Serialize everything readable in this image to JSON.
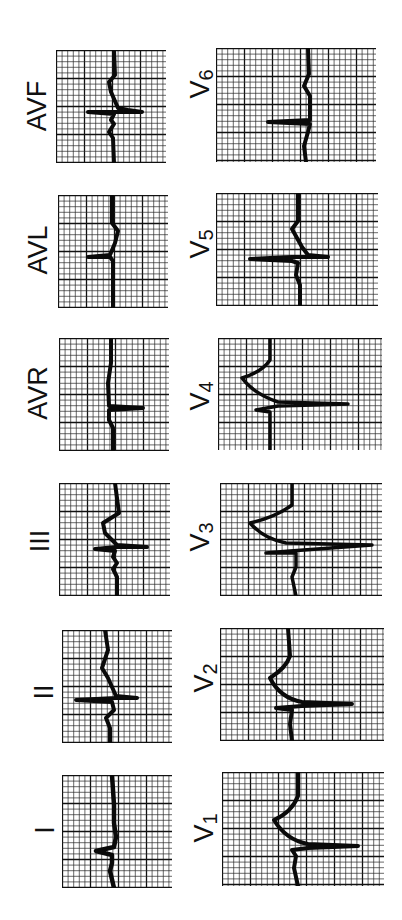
{
  "figure": {
    "orientation": "rotated-counterclockwise",
    "grid": {
      "minor_color": "#2a2a2a",
      "major_color": "#111111",
      "trace_color": "#0a0a0a"
    }
  },
  "columns": [
    {
      "name": "limb-leads",
      "leads": [
        "I",
        "II",
        "III",
        "AVR",
        "AVL",
        "AVF"
      ]
    },
    {
      "name": "precordial-leads",
      "leads": [
        "V1",
        "V2",
        "V3",
        "V4",
        "V5",
        "V6"
      ]
    }
  ],
  "panels": [
    {
      "id": "avf",
      "label": "AVF",
      "label_main": "AVF",
      "label_sub": "",
      "box": {
        "x": 56,
        "y": 50,
        "w": 110,
        "h": 113
      },
      "label_pos": {
        "x": 37,
        "y": 106
      },
      "trace": "M58 0 L59 25 L53 32 L55 42 L62 58 L72 60 L86 62 L62 62 L32 62 L58 64 L55 70 L58 74 L53 82 L57 88 L58 113",
      "trace_width": 4
    },
    {
      "id": "avl",
      "label": "AVL",
      "label_main": "AVL",
      "label_sub": "",
      "box": {
        "x": 58,
        "y": 195,
        "w": 110,
        "h": 113
      },
      "label_pos": {
        "x": 38,
        "y": 250
      },
      "trace": "M54 0 L54 28 L60 36 L57 48 L52 60 L30 62 L52 62 L55 66 L55 113",
      "trace_width": 4
    },
    {
      "id": "avr",
      "label": "AVR",
      "label_main": "AVR",
      "label_sub": "",
      "box": {
        "x": 59,
        "y": 338,
        "w": 110,
        "h": 113
      },
      "label_pos": {
        "x": 38,
        "y": 393
      },
      "trace": "M52 0 L52 25 L49 45 L50 68 L84 70 L50 72 L50 82 L54 90 L54 113",
      "trace_width": 4
    },
    {
      "id": "iii",
      "label": "III",
      "label_main": "III",
      "label_sub": "",
      "box": {
        "x": 59,
        "y": 483,
        "w": 111,
        "h": 113
      },
      "label_pos": {
        "x": 40,
        "y": 541
      },
      "trace": "M56 0 L60 30 L44 40 L46 50 L58 62 L88 64 L58 64 L36 66 L56 68 L54 74 L58 80 L54 86 L58 94 L58 113",
      "trace_width": 4
    },
    {
      "id": "ii",
      "label": "II",
      "label_main": "II",
      "label_sub": "",
      "box": {
        "x": 62,
        "y": 630,
        "w": 110,
        "h": 113
      },
      "label_pos": {
        "x": 44,
        "y": 692
      },
      "trace": "M43 0 L46 20 L40 38 L46 48 L54 66 L75 68 L54 68 L14 70 L50 72 L52 80 L44 88 L48 98 L48 113",
      "trace_width": 4
    },
    {
      "id": "i",
      "label": "I",
      "label_main": "I",
      "label_sub": "",
      "box": {
        "x": 62,
        "y": 775,
        "w": 110,
        "h": 113
      },
      "label_pos": {
        "x": 45,
        "y": 830
      },
      "trace": "M50 0 L52 30 L52 48 L54 62 L52 72 L34 76 L50 80 L50 88 L48 96 L52 113",
      "trace_width": 4.5
    },
    {
      "id": "v6",
      "label": "V6",
      "label_main": "V",
      "label_sub": "6",
      "box": {
        "x": 216,
        "y": 48,
        "w": 160,
        "h": 114
      },
      "label_pos": {
        "x": 201,
        "y": 84
      },
      "trace": "M92 0 L93 26 L88 38 L94 48 L94 72 L52 74 L94 76 L92 84 L88 98 L90 114",
      "trace_width": 4
    },
    {
      "id": "v5",
      "label": "V5",
      "label_main": "V",
      "label_sub": "5",
      "box": {
        "x": 216,
        "y": 193,
        "w": 162,
        "h": 113
      },
      "label_pos": {
        "x": 201,
        "y": 244
      },
      "trace": "M82 0 L82 28 L76 36 L86 54 L92 62 L112 64 L76 64 L34 66 L76 68 L82 70 L80 82 L84 92 L84 113",
      "trace_width": 4
    },
    {
      "id": "v4",
      "label": "V4",
      "label_main": "V",
      "label_sub": "4",
      "box": {
        "x": 218,
        "y": 338,
        "w": 164,
        "h": 112
      },
      "label_pos": {
        "x": 201,
        "y": 396
      },
      "trace": "M52 0 L52 22 Q44 34 24 40 Q36 56 60 64 L130 66 L60 68 L38 72 L52 74 L52 90 L52 112",
      "trace_width": 3.5
    },
    {
      "id": "v3",
      "label": "V3",
      "label_main": "V",
      "label_sub": "3",
      "box": {
        "x": 220,
        "y": 483,
        "w": 162,
        "h": 113
      },
      "label_pos": {
        "x": 201,
        "y": 537
      },
      "trace": "M72 0 L72 22 Q56 34 30 40 Q44 56 66 60 L152 62 L70 68 L46 70 L76 70 L76 84 L72 94 L76 113",
      "trace_width": 3.5
    },
    {
      "id": "v2",
      "label": "V2",
      "label_main": "V",
      "label_sub": "2",
      "box": {
        "x": 220,
        "y": 628,
        "w": 164,
        "h": 113
      },
      "label_pos": {
        "x": 205,
        "y": 678
      },
      "trace": "M68 0 L70 28 Q66 40 50 50 Q60 70 82 74 L132 76 L82 78 L56 80 L72 82 L70 96 L72 113",
      "trace_width": 4
    },
    {
      "id": "v1",
      "label": "V1",
      "label_main": "V",
      "label_sub": "1",
      "box": {
        "x": 222,
        "y": 772,
        "w": 162,
        "h": 114
      },
      "label_pos": {
        "x": 205,
        "y": 828
      },
      "trace": "M76 0 L76 24 Q70 40 52 48 Q64 68 86 72 L136 74 L86 76 L70 78 L74 84 L72 96 L76 114",
      "trace_width": 4
    }
  ]
}
